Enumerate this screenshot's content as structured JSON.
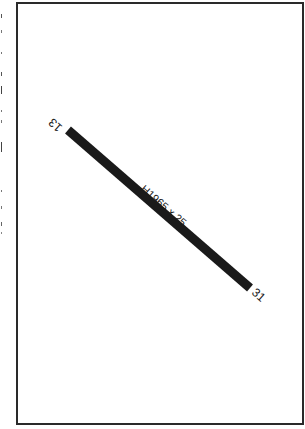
{
  "diagram": {
    "type": "airport-runway-diagram",
    "runway": {
      "designation": "H1965 x 25",
      "end_a": "13",
      "end_b": "31",
      "color": "#1a1a1a"
    },
    "frame_color": "#2a2a2a",
    "background": "#ffffff"
  }
}
